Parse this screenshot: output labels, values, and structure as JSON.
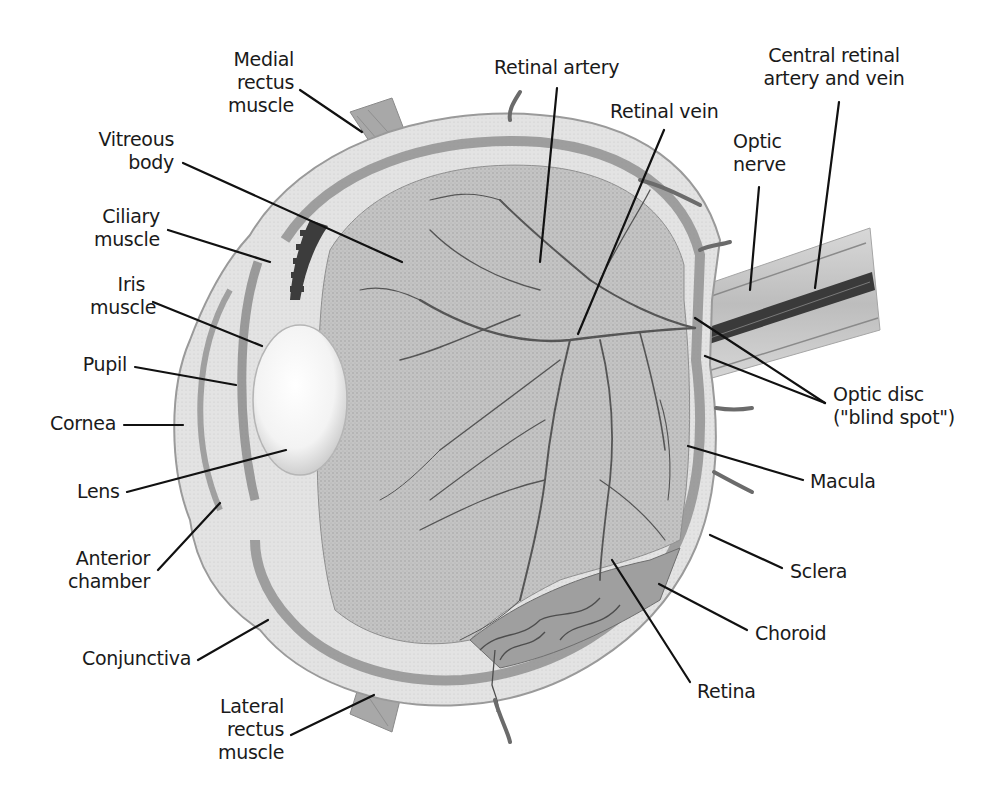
{
  "diagram": {
    "type": "anatomical-cross-section",
    "colors": {
      "background": "#ffffff",
      "text": "#1a1a1a",
      "leader": "#111111",
      "sclera": "#e6e6e6",
      "sclera_edge": "#9a9a9a",
      "choroid": "#8c8c8c",
      "retina_interior": "#bdbdbd",
      "vessel": "#5a5a5a",
      "lens": "#f7f7f7",
      "ciliary_dark": "#3c3c3c",
      "optic_nerve": "#c9c9c9",
      "central_vessel": "#3a3a3a"
    },
    "labels": [
      {
        "id": "medial-rectus-muscle",
        "text": "Medial\nrectus\nmuscle",
        "x": 222,
        "y": 48,
        "w": 72,
        "align": "r",
        "line": [
          [
            300,
            90
          ],
          [
            362,
            132
          ]
        ]
      },
      {
        "id": "vitreous-body",
        "text": "Vitreous\nbody",
        "x": 94,
        "y": 128,
        "w": 80,
        "align": "r",
        "line": [
          [
            183,
            163
          ],
          [
            402,
            262
          ]
        ]
      },
      {
        "id": "ciliary-muscle",
        "text": "Ciliary\nmuscle",
        "x": 90,
        "y": 205,
        "w": 70,
        "align": "r",
        "line": [
          [
            168,
            230
          ],
          [
            270,
            262
          ]
        ]
      },
      {
        "id": "iris-muscle",
        "text": "Iris\nmuscle",
        "x": 90,
        "y": 273,
        "w": 55,
        "align": "r",
        "line": [
          [
            153,
            302
          ],
          [
            262,
            346
          ]
        ]
      },
      {
        "id": "pupil",
        "text": "Pupil",
        "x": 80,
        "y": 353,
        "w": 47,
        "align": "r",
        "line": [
          [
            135,
            367
          ],
          [
            236,
            385
          ]
        ]
      },
      {
        "id": "cornea",
        "text": "Cornea",
        "x": 44,
        "y": 412,
        "w": 72,
        "align": "r",
        "line": [
          [
            124,
            425
          ],
          [
            183,
            425
          ]
        ]
      },
      {
        "id": "lens",
        "text": "Lens",
        "x": 77,
        "y": 480,
        "w": 42,
        "align": "r",
        "line": [
          [
            127,
            492
          ],
          [
            286,
            450
          ]
        ]
      },
      {
        "id": "anterior-chamber",
        "text": "Anterior\nchamber",
        "x": 62,
        "y": 547,
        "w": 88,
        "align": "r",
        "line": [
          [
            158,
            570
          ],
          [
            220,
            503
          ]
        ]
      },
      {
        "id": "conjunctiva",
        "text": "Conjunctiva",
        "x": 75,
        "y": 647,
        "w": 116,
        "align": "r",
        "line": [
          [
            198,
            660
          ],
          [
            268,
            620
          ]
        ]
      },
      {
        "id": "lateral-rectus-muscle",
        "text": "Lateral\nrectus\nmuscle",
        "x": 218,
        "y": 695,
        "w": 66,
        "align": "r",
        "line": [
          [
            291,
            735
          ],
          [
            374,
            695
          ]
        ]
      },
      {
        "id": "retinal-artery",
        "text": "Retinal artery",
        "x": 494,
        "y": 56,
        "w": 128,
        "align": "l",
        "line": [
          [
            557,
            88
          ],
          [
            540,
            262
          ]
        ]
      },
      {
        "id": "retinal-vein",
        "text": "Retinal vein",
        "x": 610,
        "y": 100,
        "w": 110,
        "align": "l",
        "line": [
          [
            664,
            130
          ],
          [
            578,
            334
          ]
        ]
      },
      {
        "id": "central-retinal-artery-and-vein",
        "text": "Central retinal\nartery and vein",
        "x": 763,
        "y": 44,
        "w": 142,
        "align": "c",
        "line": [
          [
            839,
            102
          ],
          [
            815,
            288
          ]
        ]
      },
      {
        "id": "optic-nerve",
        "text": "Optic\nnerve",
        "x": 733,
        "y": 130,
        "w": 56,
        "align": "l",
        "line": [
          [
            759,
            187
          ],
          [
            750,
            290
          ]
        ]
      },
      {
        "id": "optic-disc",
        "text": "Optic disc\n(\"blind spot\")",
        "x": 833,
        "y": 383,
        "w": 126,
        "align": "l",
        "lines": [
          [
            [
              825,
              403
            ],
            [
              695,
              318
            ]
          ],
          [
            [
              825,
              403
            ],
            [
              705,
              356
            ]
          ]
        ]
      },
      {
        "id": "macula",
        "text": "Macula",
        "x": 810,
        "y": 470,
        "w": 75,
        "align": "l",
        "line": [
          [
            803,
            480
          ],
          [
            688,
            446
          ]
        ]
      },
      {
        "id": "sclera",
        "text": "Sclera",
        "x": 790,
        "y": 560,
        "w": 65,
        "align": "l",
        "line": [
          [
            782,
            568
          ],
          [
            710,
            535
          ]
        ]
      },
      {
        "id": "choroid",
        "text": "Choroid",
        "x": 755,
        "y": 622,
        "w": 80,
        "align": "l",
        "line": [
          [
            747,
            630
          ],
          [
            659,
            584
          ]
        ]
      },
      {
        "id": "retina",
        "text": "Retina",
        "x": 697,
        "y": 680,
        "w": 62,
        "align": "l",
        "line": [
          [
            690,
            682
          ],
          [
            612,
            560
          ]
        ]
      }
    ]
  }
}
